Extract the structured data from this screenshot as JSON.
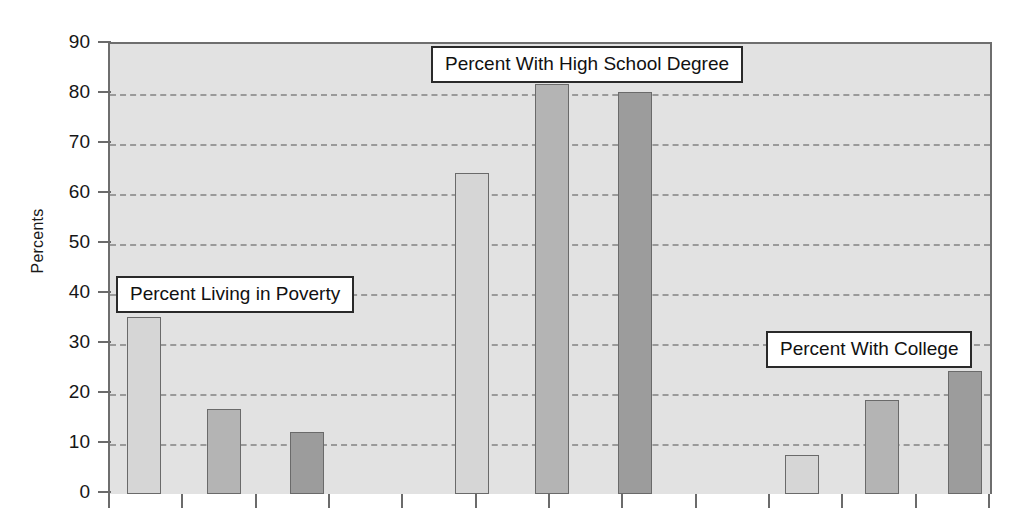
{
  "chart_data": {
    "type": "bar",
    "title": "",
    "xlabel": "",
    "ylabel": "Percents",
    "ylim": [
      0,
      90
    ],
    "ytick_values": [
      0,
      10,
      20,
      30,
      40,
      50,
      60,
      70,
      80,
      90
    ],
    "ytick_labels": [
      "0",
      "10",
      "20",
      "30",
      "40",
      "50",
      "60",
      "70",
      "80",
      "90"
    ],
    "grid": true,
    "grid_style": "dashed-horizontal",
    "legend": "none",
    "plot_background": "#e2e2e2",
    "bar_colors": [
      "#d6d6d6",
      "#b4b4b4",
      "#9c9c9c"
    ],
    "groups": [
      {
        "name": "Percent Living in Poverty",
        "values": [
          35.5,
          17.1,
          12.4
        ]
      },
      {
        "name": "Percent With High School Degree",
        "values": [
          64.2,
          82.1,
          80.5
        ]
      },
      {
        "name": "Percent With College",
        "values": [
          7.8,
          18.8,
          24.7
        ]
      }
    ],
    "bars": [
      {
        "group": "Percent Living in Poverty",
        "series_index": 0,
        "value": 35.5,
        "color": "#d6d6d6"
      },
      {
        "group": "Percent Living in Poverty",
        "series_index": 1,
        "value": 17.1,
        "color": "#b4b4b4"
      },
      {
        "group": "Percent Living in Poverty",
        "series_index": 2,
        "value": 12.4,
        "color": "#9c9c9c"
      },
      {
        "group": "Percent With High School Degree",
        "series_index": 0,
        "value": 64.2,
        "color": "#d6d6d6"
      },
      {
        "group": "Percent With High School Degree",
        "series_index": 1,
        "value": 82.1,
        "color": "#b4b4b4"
      },
      {
        "group": "Percent With High School Degree",
        "series_index": 2,
        "value": 80.5,
        "color": "#9c9c9c"
      },
      {
        "group": "Percent With College",
        "series_index": 0,
        "value": 7.8,
        "color": "#d6d6d6"
      },
      {
        "group": "Percent With College",
        "series_index": 1,
        "value": 18.8,
        "color": "#b4b4b4"
      },
      {
        "group": "Percent With College",
        "series_index": 2,
        "value": 24.7,
        "color": "#9c9c9c"
      }
    ],
    "annotations": [
      {
        "text": "Percent Living in Poverty",
        "style": "boxed-callout"
      },
      {
        "text": "Percent With High School Degree",
        "style": "boxed-callout"
      },
      {
        "text": "Percent With College",
        "style": "boxed-callout"
      }
    ]
  },
  "callouts": {
    "poverty": "Percent Living in Poverty",
    "highschool": "Percent With High School Degree",
    "college": "Percent With College"
  },
  "axis": {
    "y_title": "Percents"
  }
}
